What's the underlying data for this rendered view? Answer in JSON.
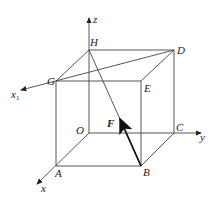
{
  "diagram": {
    "type": "3d-cube-force-vector",
    "axes": {
      "x": "x",
      "y": "y",
      "z": "z",
      "x1": "x",
      "x1_subscript": "1"
    },
    "vertices": {
      "O": "O",
      "A": "A",
      "B": "B",
      "C": "C",
      "D": "D",
      "E": "E",
      "G": "G",
      "H": "H"
    },
    "force": {
      "label": "F",
      "from": "B",
      "toward": "H"
    },
    "colors": {
      "line": "#333333",
      "background": "#ffffff"
    }
  }
}
